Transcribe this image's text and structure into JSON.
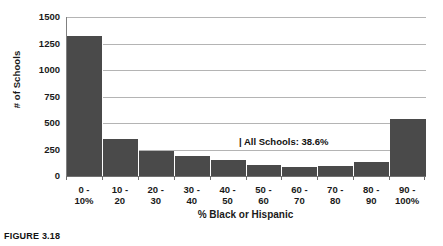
{
  "caption": "FIGURE 3.18",
  "annotation": "| All Schools: 38.6%",
  "colors": {
    "bar": "#4a4a4a",
    "gridline": "#b4b4b4",
    "axis": "#707070",
    "background": "#ffffff",
    "text": "#1a1a1a"
  },
  "chart_data": {
    "type": "bar",
    "title": "",
    "xlabel": "% Black or Hispanic",
    "ylabel": "# of Schools",
    "categories": [
      "0 -\n10%",
      "10 -\n20",
      "20 -\n30",
      "30 -\n40",
      "40 -\n50",
      "50 -\n60",
      "60 -\n70",
      "70 -\n80",
      "80 -\n90",
      "90 -\n100%"
    ],
    "category_lines": [
      [
        "0 -",
        "10%"
      ],
      [
        "10 -",
        "20"
      ],
      [
        "20 -",
        "30"
      ],
      [
        "30 -",
        "40"
      ],
      [
        "40 -",
        "50"
      ],
      [
        "50 -",
        "60"
      ],
      [
        "60 -",
        "70"
      ],
      [
        "70 -",
        "80"
      ],
      [
        "80 -",
        "90"
      ],
      [
        "90 -",
        "100%"
      ]
    ],
    "values": [
      1320,
      345,
      240,
      185,
      150,
      100,
      85,
      90,
      135,
      540
    ],
    "ylim": [
      0,
      1500
    ],
    "yticks": [
      0,
      250,
      500,
      750,
      1000,
      1250,
      1500
    ],
    "ytick_labels": [
      "0",
      "250",
      "500",
      "750",
      "1000",
      "1250",
      "1500"
    ],
    "grid": true,
    "legend": "none",
    "annotations": [
      {
        "text": "| All Schools: 38.6%",
        "value": "38.6%",
        "label": "All Schools"
      }
    ]
  }
}
